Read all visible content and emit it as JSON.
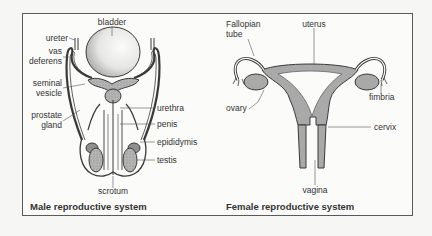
{
  "male": {
    "title": "Male reproductive system",
    "labels": {
      "bladder": "bladder",
      "ureter": "ureter",
      "vas_deferens_1": "vas",
      "vas_deferens_2": "deferens",
      "seminal_vesicle_1": "seminal",
      "seminal_vesicle_2": "vesicle",
      "prostate_gland_1": "prostate",
      "prostate_gland_2": "gland",
      "urethra": "urethra",
      "penis": "penis",
      "epididymis": "epididymis",
      "testis": "testis",
      "scrotum": "scrotum"
    }
  },
  "female": {
    "title": "Female reproductive system",
    "labels": {
      "fallopian_tube_1": "Fallopian",
      "fallopian_tube_2": "tube",
      "uterus": "uterus",
      "ovary": "ovary",
      "fimbria": "fimbria",
      "cervix": "cervix",
      "vagina": "vagina"
    }
  },
  "colors": {
    "tissue_fill": "#a9a9a9",
    "outline": "#3a3a3a",
    "frame": "#5a5a5a"
  }
}
